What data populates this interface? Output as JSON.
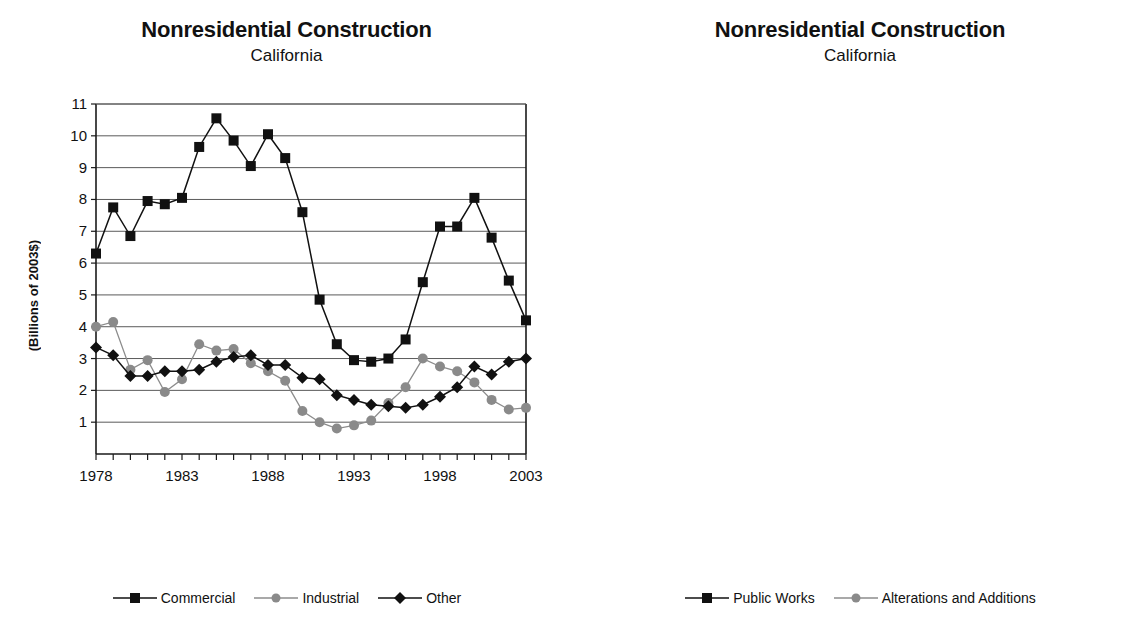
{
  "charts": [
    {
      "id": "left",
      "title": "Nonresidential Construction",
      "subtitle": "California",
      "ylabel": "(Billions of 2003$)"
    },
    {
      "id": "right",
      "title": "Nonresidential Construction",
      "subtitle": "California",
      "ylabel": "(Billions of 2003$)"
    }
  ],
  "chart_data": [
    {
      "type": "line",
      "title": "Nonresidential Construction",
      "subtitle": "California",
      "xlabel": "",
      "ylabel": "(Billions of 2003$)",
      "ylim": [
        0,
        11
      ],
      "yticks": [
        1,
        2,
        3,
        4,
        5,
        6,
        7,
        8,
        9,
        10,
        11
      ],
      "xlim": [
        1978,
        2003
      ],
      "xticks": [
        1978,
        1983,
        1988,
        1993,
        1998,
        2003
      ],
      "grid": true,
      "legend_position": "bottom",
      "x": [
        1978,
        1979,
        1980,
        1981,
        1982,
        1983,
        1984,
        1985,
        1986,
        1987,
        1988,
        1989,
        1990,
        1991,
        1992,
        1993,
        1994,
        1995,
        1996,
        1997,
        1998,
        1999,
        2000,
        2001,
        2002,
        2003
      ],
      "series": [
        {
          "name": "Commercial",
          "marker": "square",
          "color": "#111111",
          "values": [
            6.3,
            7.75,
            6.85,
            7.95,
            7.85,
            8.05,
            9.65,
            10.55,
            9.85,
            9.05,
            10.05,
            9.3,
            7.6,
            4.85,
            3.45,
            2.95,
            2.9,
            3.0,
            3.6,
            5.4,
            7.15,
            7.15,
            8.05,
            6.8,
            5.45,
            4.2
          ]
        },
        {
          "name": "Industrial",
          "marker": "circle",
          "color": "#8a8a8a",
          "values": [
            4.0,
            4.15,
            2.65,
            2.95,
            1.95,
            2.35,
            3.45,
            3.25,
            3.3,
            2.85,
            2.6,
            2.3,
            1.35,
            1.0,
            0.8,
            0.9,
            1.05,
            1.6,
            2.1,
            3.0,
            2.75,
            2.6,
            2.25,
            1.7,
            1.4,
            1.45
          ]
        },
        {
          "name": "Other",
          "marker": "diamond",
          "color": "#111111",
          "values": [
            3.35,
            3.1,
            2.45,
            2.45,
            2.6,
            2.6,
            2.65,
            2.9,
            3.05,
            3.1,
            2.8,
            2.8,
            2.4,
            2.35,
            1.85,
            1.7,
            1.55,
            1.5,
            1.45,
            1.55,
            1.8,
            2.1,
            2.75,
            2.5,
            2.9,
            3.0
          ]
        }
      ]
    },
    {
      "type": "line",
      "title": "Nonresidential Construction",
      "subtitle": "California",
      "xlabel": "",
      "ylabel": "(Billions of 2003$)",
      "ylim": [
        0,
        10
      ],
      "yticks": [
        1,
        2,
        3,
        4,
        5,
        6,
        7,
        8,
        9,
        10
      ],
      "xlim": [
        1978,
        2003
      ],
      "xticks": [
        1978,
        1983,
        1988,
        1993,
        1998,
        2003
      ],
      "grid": true,
      "legend_position": "bottom",
      "x": [
        1978,
        1979,
        1980,
        1981,
        1982,
        1983,
        1984,
        1985,
        1986,
        1987,
        1988,
        1989,
        1990,
        1991,
        1992,
        1993,
        1994,
        1995,
        1996,
        1997,
        1998,
        1999,
        2000,
        2001,
        2002,
        2003
      ],
      "series": [
        {
          "name": "Public Works",
          "marker": "square",
          "color": "#111111",
          "values": [
            4.9,
            4.9,
            4.9,
            5.55,
            4.05,
            4.4,
            4.15,
            6.4,
            6.4,
            6.1,
            7.55,
            7.1,
            6.8,
            8.5,
            7.5,
            9.35,
            9.6,
            10.05,
            9.05,
            8.85,
            8.8,
            9.25,
            9.95,
            10.05,
            9.35,
            7.45
          ]
        },
        {
          "name": "Alterations and Additions",
          "marker": "circle",
          "color": "#8a8a8a",
          "values": [
            1.55,
            1.65,
            3.6,
            4.1,
            3.95,
            4.85,
            4.75,
            5.55,
            5.5,
            5.85,
            6.2,
            6.5,
            6.1,
            5.75,
            5.4,
            5.35,
            5.45,
            5.35,
            5.9,
            6.35,
            6.35,
            7.1,
            7.85,
            6.9,
            5.65,
            5.75
          ]
        }
      ]
    }
  ]
}
